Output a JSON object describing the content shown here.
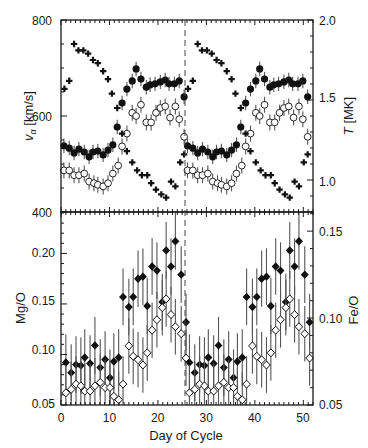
{
  "chart_data": [
    {
      "panel": "upper",
      "type": "scatter",
      "xlabel": "Day of Cycle",
      "xlim": [
        0,
        52
      ],
      "x_ticks": [
        0,
        10,
        20,
        30,
        40,
        50
      ],
      "ylabel_left": "v_α [km/s]",
      "ylim_left": [
        400,
        800
      ],
      "y_ticks_left": [
        400,
        600,
        800
      ],
      "ylabel_right": "T [MK]",
      "ylim_right": [
        0.8,
        2.0
      ],
      "y_ticks_right": [
        1.0,
        1.5,
        2.0
      ],
      "grid": false,
      "vertical_marker_day": 25.5,
      "repeat_period_days": 25.5,
      "series": [
        {
          "name": "v_alpha (filled circles)",
          "axis": "left",
          "marker": "filled-circle",
          "err": 15,
          "x": [
            0.6,
            1.7,
            2.7,
            3.7,
            4.8,
            5.8,
            6.6,
            7.6,
            8.7,
            9.7,
            10.7,
            11.6,
            12.6,
            13.6,
            14.7,
            15.5,
            16.5,
            17.6,
            18.4,
            19.4,
            20.5,
            21.5,
            22.3,
            23.4,
            24.4,
            25.4
          ],
          "values": [
            538,
            533,
            523,
            531,
            525,
            515,
            525,
            527,
            519,
            529,
            540,
            577,
            627,
            656,
            673,
            698,
            677,
            660,
            665,
            667,
            671,
            675,
            667,
            667,
            673,
            640
          ]
        },
        {
          "name": "T (open circles)",
          "axis": "right",
          "marker": "open-circle",
          "err": 0.05,
          "x": [
            0.6,
            1.7,
            2.7,
            3.7,
            4.8,
            5.8,
            6.8,
            7.6,
            8.7,
            9.7,
            10.7,
            11.8,
            12.6,
            13.6,
            14.7,
            15.5,
            16.5,
            17.6,
            18.6,
            19.6,
            20.5,
            21.5,
            22.5,
            23.6,
            24.4,
            25.4
          ],
          "values": [
            1.06,
            1.06,
            1.03,
            1.03,
            1.04,
            0.99,
            0.98,
            0.97,
            0.96,
            0.98,
            1.04,
            1.09,
            1.21,
            1.29,
            1.42,
            1.4,
            1.47,
            1.36,
            1.36,
            1.42,
            1.45,
            1.46,
            1.39,
            1.46,
            1.38,
            1.27
          ]
        },
        {
          "name": "T (crosses)",
          "axis": "right",
          "marker": "cross",
          "err": 0,
          "x": [
            0.7,
            1.7,
            2.7,
            3.6,
            4.6,
            5.6,
            6.6,
            7.6,
            8.7,
            9.7,
            10.5,
            11.6,
            12.6,
            13.6,
            14.7,
            15.7,
            16.7,
            17.8,
            18.6,
            19.6,
            20.7,
            21.7,
            22.7,
            23.6,
            24.6,
            25.4
          ],
          "values": [
            1.57,
            1.62,
            1.85,
            1.81,
            1.81,
            1.79,
            1.75,
            1.73,
            1.68,
            1.63,
            1.54,
            1.45,
            1.29,
            1.18,
            1.11,
            1.06,
            1.03,
            1.03,
            0.98,
            0.94,
            0.91,
            0.89,
            0.99,
            0.96,
            1.11,
            1.16
          ]
        }
      ]
    },
    {
      "panel": "lower",
      "type": "scatter",
      "xlabel": "Day of Cycle",
      "xlim": [
        0,
        52
      ],
      "x_ticks": [
        0,
        10,
        20,
        30,
        40,
        50
      ],
      "ylabel_left": "Mg/O",
      "ylim_left": [
        0.05,
        0.241
      ],
      "y_ticks_left": [
        0.05,
        0.1,
        0.15,
        0.2
      ],
      "ylabel_right": "Fe/O",
      "ylim_right": [
        0.05,
        0.161
      ],
      "y_ticks_right": [
        0.05,
        0.1,
        0.15
      ],
      "grid": false,
      "vertical_marker_day": 25.5,
      "repeat_period_days": 25.5,
      "series": [
        {
          "name": "Mg/O (filled diamonds)",
          "axis": "left",
          "marker": "filled-diamond",
          "err": 0.028,
          "x": [
            1.0,
            2.1,
            3.1,
            4.1,
            4.9,
            6.0,
            7.0,
            8.1,
            9.1,
            10.1,
            10.9,
            11.9,
            12.8,
            14.0,
            14.9,
            15.9,
            16.9,
            17.8,
            18.8,
            19.8,
            20.9,
            21.7,
            22.7,
            23.6,
            24.8,
            25.8
          ],
          "values": [
            0.092,
            0.082,
            0.09,
            0.089,
            0.097,
            0.091,
            0.109,
            0.087,
            0.095,
            0.077,
            0.093,
            0.097,
            0.157,
            0.147,
            0.157,
            0.175,
            0.177,
            0.148,
            0.187,
            0.183,
            0.152,
            0.203,
            0.187,
            0.212,
            0.179,
            0.132
          ]
        },
        {
          "name": "Fe/O (open diamonds)",
          "axis": "right",
          "marker": "open-diamond",
          "err": 0.016,
          "x": [
            1.0,
            2.1,
            3.1,
            4.1,
            4.9,
            6.0,
            7.0,
            8.1,
            9.1,
            10.1,
            10.9,
            11.9,
            12.8,
            14.0,
            14.9,
            15.9,
            16.9,
            17.8,
            18.8,
            19.8,
            20.9,
            21.7,
            22.7,
            23.6,
            24.8,
            25.8
          ],
          "values": [
            0.057,
            0.059,
            0.062,
            0.061,
            0.058,
            0.058,
            0.061,
            0.063,
            0.06,
            0.06,
            0.055,
            0.053,
            0.062,
            0.084,
            0.078,
            0.076,
            0.073,
            0.08,
            0.093,
            0.099,
            0.106,
            0.111,
            0.102,
            0.095,
            0.091,
            0.077
          ]
        }
      ]
    }
  ],
  "labels": {
    "upper_left_axis_v": "v",
    "upper_left_axis_sub": "α",
    "upper_left_axis_unit": " [km/s]",
    "upper_right_axis_T": "T",
    "upper_right_axis_unit": " [MK]",
    "lower_left_axis": "Mg/O",
    "lower_right_axis": "Fe/O",
    "x_axis": "Day of Cycle"
  },
  "tick_labels": {
    "upper_left": [
      "800",
      "600",
      "400"
    ],
    "upper_right": [
      "2.0",
      "1.5",
      "1.0"
    ],
    "lower_left": [
      "0.20",
      "0.15",
      "0.10",
      "0.05"
    ],
    "lower_right": [
      "0.15",
      "0.10",
      "0.05"
    ],
    "x": [
      "0",
      "10",
      "20",
      "30",
      "40",
      "50"
    ]
  }
}
